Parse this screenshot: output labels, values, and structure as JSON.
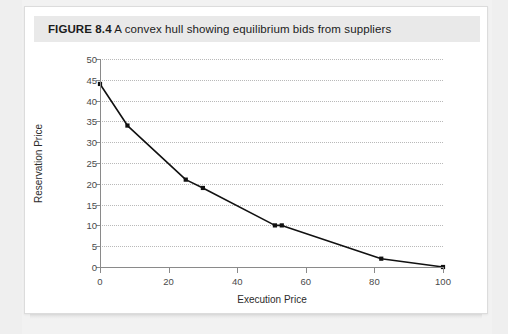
{
  "figure": {
    "number_label": "FIGURE 8.4",
    "caption": " A convex hull showing equilibrium bids from suppliers"
  },
  "chart_data": {
    "type": "line",
    "title": "A convex hull showing equilibrium bids from suppliers",
    "xlabel": "Execution Price",
    "ylabel": "Reservation Price",
    "xlim": [
      0,
      100
    ],
    "ylim": [
      0,
      50
    ],
    "xticks": [
      0,
      20,
      40,
      60,
      80,
      100
    ],
    "xtick_labels": [
      "0",
      "20",
      "40",
      "60",
      "80",
      "100"
    ],
    "yticks": [
      0,
      5,
      10,
      15,
      20,
      25,
      30,
      35,
      40,
      45,
      50
    ],
    "ytick_labels": [
      "0",
      "5",
      "10",
      "15",
      "20",
      "25",
      "30",
      "35",
      "40",
      "45",
      "50"
    ],
    "grid": "horizontal-dotted",
    "legend": null,
    "series": [
      {
        "name": "Equilibrium bids",
        "marker": "square",
        "color": "#111111",
        "x": [
          0,
          8,
          25,
          30,
          51,
          53,
          82,
          100
        ],
        "y": [
          44,
          34,
          21,
          19,
          10,
          10,
          2,
          0
        ],
        "points": [
          {
            "x": 0,
            "y": 44
          },
          {
            "x": 8,
            "y": 34
          },
          {
            "x": 25,
            "y": 21
          },
          {
            "x": 30,
            "y": 19
          },
          {
            "x": 51,
            "y": 10
          },
          {
            "x": 53,
            "y": 10
          },
          {
            "x": 82,
            "y": 2
          },
          {
            "x": 100,
            "y": 0
          }
        ]
      }
    ]
  },
  "colors": {
    "page_background": "#f2f2f2",
    "card_background": "#ffffff",
    "title_band": "#e9e9e9",
    "axis": "#8a8a8a",
    "gridline": "#b9b9b9",
    "series": "#111111",
    "text": "#1b1b1b"
  }
}
